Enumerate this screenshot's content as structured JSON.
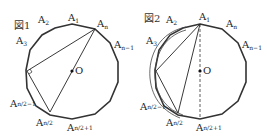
{
  "figures": [
    {
      "caption": "図1",
      "center_label": "O",
      "labels": {
        "a1": {
          "base": "A",
          "sub": "1"
        },
        "a2": {
          "base": "A",
          "sub": "2"
        },
        "a3": {
          "base": "A",
          "sub": "3"
        },
        "an": {
          "base": "A",
          "sub": "n"
        },
        "an1": {
          "base": "A",
          "sub": "n−1"
        },
        "ah1": {
          "base": "A",
          "sub": "n/2−1"
        },
        "ah": {
          "base": "A",
          "sub": "n/2"
        },
        "ahp": {
          "base": "A",
          "sub": "n/2+1"
        }
      }
    },
    {
      "caption": "図2",
      "center_label": "O",
      "labels": {
        "a1": {
          "base": "A",
          "sub": "1"
        },
        "a2": {
          "base": "A",
          "sub": "2"
        },
        "a3": {
          "base": "A",
          "sub": "3"
        },
        "an": {
          "base": "A",
          "sub": "n"
        },
        "an1": {
          "base": "A",
          "sub": "n−1"
        },
        "ah1": {
          "base": "A",
          "sub": "n/2−1"
        },
        "ah": {
          "base": "A",
          "sub": "n/2"
        },
        "ahp": {
          "base": "A",
          "sub": "n/2+1"
        }
      }
    }
  ]
}
